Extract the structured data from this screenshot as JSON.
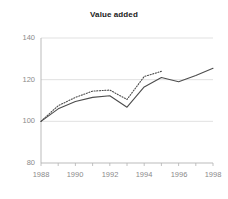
{
  "chart_data": {
    "type": "line",
    "title": "Value added",
    "xlabel": "",
    "ylabel": "",
    "xlim": [
      1988,
      1998
    ],
    "ylim": [
      80,
      140
    ],
    "yticks": [
      80,
      100,
      120,
      140
    ],
    "xticks": [
      1988,
      1989,
      1990,
      1991,
      1992,
      1993,
      1994,
      1995,
      1996,
      1997,
      1998
    ],
    "xtick_labels_shown": [
      "1988",
      "1990",
      "1992",
      "1994",
      "1996",
      "1998"
    ],
    "ytick_labels": [
      "80",
      "100",
      "120",
      "140"
    ],
    "grid": "horizontal",
    "legend": "none",
    "x": [
      1988,
      1989,
      1990,
      1991,
      1992,
      1993,
      1994,
      1995,
      1996,
      1997,
      1998
    ],
    "series": [
      {
        "name": "solid",
        "style": "solid",
        "color": "#4d4d4d",
        "values": [
          100,
          106,
          109.5,
          111.5,
          112.3,
          106.8,
          116.5,
          121,
          119,
          122,
          125.5
        ]
      },
      {
        "name": "dotted",
        "style": "dotted",
        "color": "#4d4d4d",
        "values": [
          100,
          107.5,
          111.5,
          114.5,
          115,
          110.5,
          121.5,
          124,
          null,
          null,
          null
        ]
      }
    ],
    "colors": {
      "axis": "#b3b3b3",
      "grid": "#d9d9d9",
      "line": "#4d4d4d",
      "title": "#1a1a1a",
      "tick_text": "#8a8a8a",
      "background": "#ffffff"
    }
  }
}
